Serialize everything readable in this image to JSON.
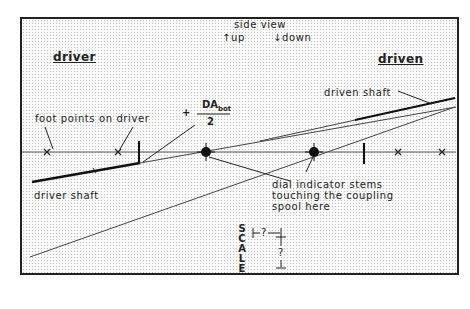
{
  "labels": {
    "driver_title": "driver",
    "driven_title": "driven",
    "side_view": "side view",
    "up": "up",
    "down": "down",
    "foot_points": "foot points on driver",
    "driver_shaft": "driver shaft",
    "driven_shaft": "driven shaft",
    "dial_line1": "dial indicator stems",
    "dial_line2": "touching the coupling",
    "dial_line3": "spool here",
    "formula_sign": "+",
    "formula_numerator": "DA",
    "formula_subscript": "bot",
    "formula_denominator": "2",
    "scale_letters": [
      "S",
      "C",
      "A",
      "L",
      "E"
    ],
    "scale_h": "?",
    "scale_v": "?"
  },
  "icons": {
    "up_arrow": "↑",
    "down_arrow": "↓"
  },
  "colors": {
    "ink": "#222222",
    "frame_bg": "#fafafa",
    "dot_grid": "#bdbdbd"
  }
}
